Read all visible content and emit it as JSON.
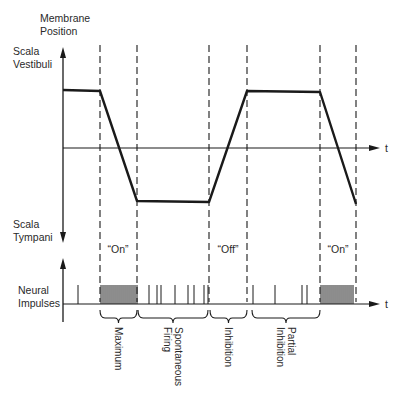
{
  "figure": {
    "y_axis_title_line1": "Membrane",
    "y_axis_title_line2": "Position",
    "top_label_line1": "Scala",
    "top_label_line2": "Vestibuli",
    "bottom_label_line1": "Scala",
    "bottom_label_line2": "Tympani",
    "time_axis_label": "t",
    "neural_time_axis_label": "t",
    "neural_label_line1": "Neural",
    "neural_label_line2": "Impulses",
    "line_color": "#1a1a1a",
    "background_color": "#ffffff"
  },
  "phases": [
    {
      "label": "“On”",
      "x_center": 118
    },
    {
      "label": "“Off”",
      "x_center": 228
    },
    {
      "label": "“On”",
      "x_center": 338
    }
  ],
  "dashed_lines_x": [
    100,
    137,
    209,
    247,
    320,
    356
  ],
  "membrane_trace": [
    [
      63,
      90
    ],
    [
      100,
      91
    ],
    [
      137,
      201
    ],
    [
      209,
      202
    ],
    [
      247,
      91
    ],
    [
      320,
      92
    ],
    [
      356,
      204
    ]
  ],
  "impulses_x": [
    78,
    101,
    103,
    105,
    107,
    109,
    111,
    113,
    115,
    117,
    119,
    121,
    123,
    125,
    127,
    129,
    131,
    133,
    135,
    137,
    149,
    157,
    161,
    175,
    188,
    194,
    204,
    208,
    253,
    275,
    302,
    307,
    321,
    323,
    325,
    327,
    329,
    331,
    333,
    335,
    337,
    339,
    341,
    343,
    345,
    347,
    349,
    351,
    353
  ],
  "response_braces": [
    {
      "label_line1": "Maximum",
      "label_line2": "",
      "x1": 100,
      "x2": 137
    },
    {
      "label_line1": "Spontaneous",
      "label_line2": "Firing",
      "x1": 138,
      "x2": 208
    },
    {
      "label_line1": "Inhibition",
      "label_line2": "",
      "x1": 210,
      "x2": 247
    },
    {
      "label_line1": "Partial",
      "label_line2": "Inhibition",
      "x1": 252,
      "x2": 320
    }
  ]
}
